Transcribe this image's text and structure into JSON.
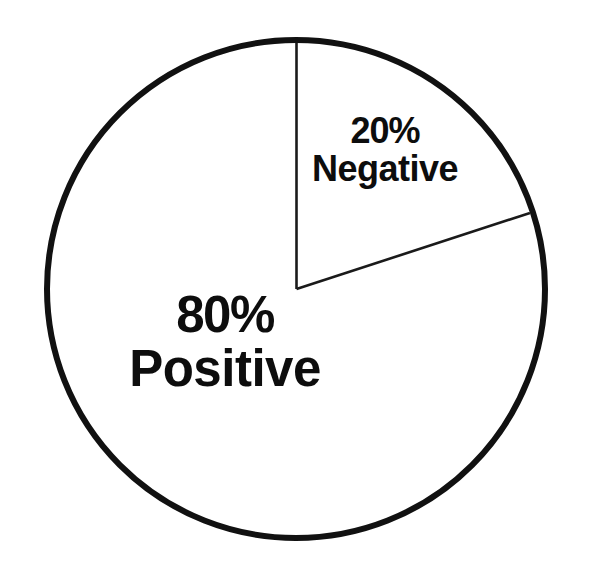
{
  "chart_data": {
    "type": "pie",
    "title": "",
    "subtitle": "",
    "xlabel": "",
    "ylabel": "",
    "grid": false,
    "legend_position": "none",
    "labels_position": "inside-slice",
    "units": "percent",
    "total": 100,
    "categories": [
      "Positive",
      "Negative"
    ],
    "values": [
      80,
      20
    ],
    "slices": [
      {
        "name": "Positive",
        "value": 80,
        "percent_label": "80%",
        "category_label": "Positive",
        "fill": "#ffffff",
        "stroke": "#111111",
        "start_angle_deg": 72,
        "end_angle_deg": 360,
        "sweep_deg": 288
      },
      {
        "name": "Negative",
        "value": 20,
        "percent_label": "20%",
        "category_label": "Negative",
        "fill": "#ffffff",
        "stroke": "#111111",
        "start_angle_deg": 0,
        "end_angle_deg": 72,
        "sweep_deg": 72
      }
    ],
    "annotations": []
  },
  "figure": {
    "background": "#ffffff",
    "outline_color": "#111111",
    "divider_color": "#1a1a1a",
    "text_color": "#0d0d0d",
    "center_x": 296,
    "center_y": 289,
    "radius": 249,
    "outline_width": 6,
    "divider_width": 2.6
  },
  "labels": {
    "negative": {
      "percent": "20%",
      "category": "Negative"
    },
    "positive": {
      "percent": "80%",
      "category": "Positive"
    }
  }
}
